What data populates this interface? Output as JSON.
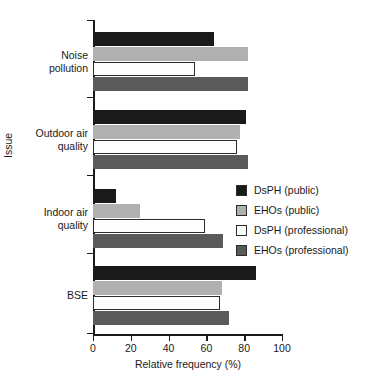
{
  "chart_data": {
    "type": "bar",
    "orientation": "horizontal",
    "title": "",
    "xlabel": "Relative frequency (%)",
    "ylabel": "Issue",
    "xlim": [
      0,
      100
    ],
    "xticks": [
      0,
      20,
      40,
      60,
      80,
      100
    ],
    "xtick_labels": [
      "0",
      "20",
      "40",
      "60",
      "80",
      "100"
    ],
    "grid": false,
    "legend_position": "right-middle",
    "categories": [
      "Noise pollution",
      "Outdoor air quality",
      "Indoor air quality",
      "BSE"
    ],
    "series": [
      {
        "name": "DsPH (public)",
        "color": "#1a1a1a",
        "values": [
          64,
          81,
          12,
          86
        ]
      },
      {
        "name": "EHOs (public)",
        "color": "#b0b0b0",
        "values": [
          82,
          78,
          25,
          68
        ]
      },
      {
        "name": "DsPH (professional)",
        "color": "#fdfdfd",
        "values": [
          54,
          76,
          59,
          67
        ]
      },
      {
        "name": "EHOs (professional)",
        "color": "#5a5a5a",
        "values": [
          82,
          82,
          69,
          72
        ]
      }
    ]
  },
  "axis": {
    "x_title": "Relative frequency (%)",
    "y_title": "Issue",
    "x_tick_labels": [
      "0",
      "20",
      "40",
      "60",
      "80",
      "100"
    ],
    "y_category_labels": [
      "Noise\npollution",
      "Outdoor air\nquality",
      "Indoor air\nquality",
      "BSE"
    ]
  },
  "legend": {
    "items": [
      {
        "label": "DsPH (public)",
        "swatch": "#1a1a1a"
      },
      {
        "label": "EHOs (public)",
        "swatch": "#b0b0b0"
      },
      {
        "label": "DsPH (professional)",
        "swatch": "#fdfdfd"
      },
      {
        "label": "EHOs (professional)",
        "swatch": "#5a5a5a"
      }
    ]
  }
}
